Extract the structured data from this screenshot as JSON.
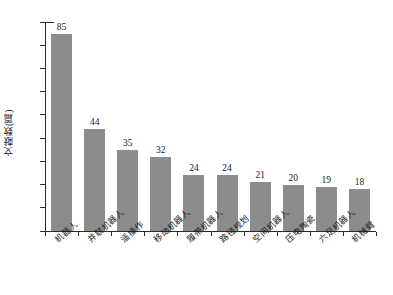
{
  "chart_data": {
    "type": "bar",
    "title": "",
    "xlabel": "",
    "ylabel": "文献数(篇)",
    "ylim": [
      0,
      90
    ],
    "ytick_step": 10,
    "grid": false,
    "legend": false,
    "bar_color": "#8c8c8c",
    "axis_color": "#2b2b2b",
    "text_color": "#1a1a1a",
    "yticks": [
      "0",
      "10",
      "20",
      "30",
      "40",
      "50",
      "60",
      "70",
      "80",
      "90"
    ],
    "categories": [
      "机器人",
      "并联机器人",
      "遥操作",
      "移动机器人",
      "履带机器人",
      "路径规划",
      "空间机器人",
      "压电陶瓷",
      "六足机器人",
      "机械臂"
    ],
    "values": [
      85,
      44,
      35,
      32,
      24,
      24,
      21,
      20,
      19,
      18
    ],
    "value_labels": [
      "85",
      "44",
      "35",
      "32",
      "24",
      "24",
      "21",
      "20",
      "19",
      "18"
    ]
  }
}
